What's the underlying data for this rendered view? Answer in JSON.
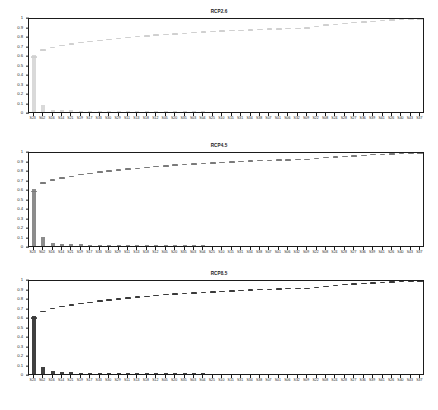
{
  "figure": {
    "caption": "",
    "panel_count": 3
  },
  "axes": {
    "yticks": [
      "0",
      "0.1",
      "0.2",
      "0.3",
      "0.4",
      "0.5",
      "0.6",
      "0.7",
      "0.8",
      "0.9",
      "1"
    ],
    "ylim": [
      0,
      1
    ],
    "xlabel": "",
    "ylabel": ""
  },
  "colors": {
    "bar_rcp26": "#d9d9d9",
    "bar_rcp45": "#8c8c8c",
    "bar_rcp85": "#404040",
    "curve_rcp26": "#d0d0d0",
    "curve_rcp45": "#7a7a7a",
    "curve_rcp85": "#3a3a3a",
    "axis": "#1b1b1b",
    "background": "#ffffff"
  },
  "chart_data": [
    {
      "type": "bar",
      "title": "RCP2.6",
      "xlabel": "",
      "ylabel": "",
      "ylim": [
        0,
        1
      ],
      "grid": false,
      "legend": "none",
      "categories": [
        "S23",
        "S02",
        "S16",
        "S14",
        "S21",
        "S19",
        "S17",
        "S33",
        "S30",
        "S29",
        "S11",
        "S13",
        "S18",
        "S12",
        "S05",
        "S20",
        "S35",
        "S03",
        "S04",
        "S25",
        "S10",
        "S15",
        "S31",
        "S34",
        "S38",
        "S07",
        "S01",
        "S06",
        "S32",
        "S09",
        "S22",
        "S08",
        "S24",
        "S28",
        "S27",
        "S36",
        "S39",
        "S41",
        "S26",
        "S40",
        "S43",
        "S37"
      ],
      "values": [
        0.6,
        0.075,
        0.025,
        0.02,
        0.016,
        0.014,
        0.013,
        0.012,
        0.011,
        0.01,
        0.009,
        0.009,
        0.008,
        0.008,
        0.007,
        0.007,
        0.006,
        0.006,
        0.006,
        0.005,
        0.005,
        0.005,
        0.004,
        0.004,
        0.004,
        0.004,
        0.003,
        0.003,
        0.003,
        0.003,
        0.002,
        0.002,
        0.002,
        0.002,
        0.002,
        0.002,
        0.001,
        0.001,
        0.001,
        0.001,
        0.001,
        0.001
      ],
      "cumulative": [
        0.6,
        0.675,
        0.7,
        0.72,
        0.736,
        0.75,
        0.763,
        0.775,
        0.786,
        0.796,
        0.805,
        0.814,
        0.822,
        0.83,
        0.837,
        0.844,
        0.85,
        0.856,
        0.862,
        0.867,
        0.872,
        0.877,
        0.881,
        0.885,
        0.889,
        0.893,
        0.896,
        0.899,
        0.902,
        0.905,
        0.921,
        0.935,
        0.945,
        0.954,
        0.962,
        0.969,
        0.976,
        0.982,
        0.988,
        0.993,
        0.997,
        1.0
      ]
    },
    {
      "type": "bar",
      "title": "RCP4.5",
      "xlabel": "",
      "ylabel": "",
      "ylim": [
        0,
        1
      ],
      "grid": false,
      "legend": "none",
      "categories": [
        "S23",
        "S02",
        "S16",
        "S14",
        "S21",
        "S19",
        "S17",
        "S33",
        "S30",
        "S29",
        "S11",
        "S13",
        "S18",
        "S12",
        "S05",
        "S20",
        "S35",
        "S03",
        "S04",
        "S25",
        "S10",
        "S15",
        "S31",
        "S34",
        "S38",
        "S07",
        "S01",
        "S06",
        "S32",
        "S09",
        "S22",
        "S08",
        "S24",
        "S28",
        "S27",
        "S36",
        "S39",
        "S41",
        "S26",
        "S40",
        "S43",
        "S37"
      ],
      "values": [
        0.595,
        0.09,
        0.03,
        0.022,
        0.018,
        0.016,
        0.014,
        0.013,
        0.012,
        0.011,
        0.01,
        0.009,
        0.009,
        0.008,
        0.008,
        0.007,
        0.007,
        0.006,
        0.006,
        0.005,
        0.005,
        0.005,
        0.004,
        0.004,
        0.004,
        0.004,
        0.003,
        0.003,
        0.003,
        0.003,
        0.003,
        0.002,
        0.002,
        0.002,
        0.002,
        0.002,
        0.002,
        0.001,
        0.001,
        0.001,
        0.001,
        0.001
      ],
      "cumulative": [
        0.595,
        0.685,
        0.715,
        0.737,
        0.755,
        0.771,
        0.785,
        0.798,
        0.81,
        0.821,
        0.831,
        0.84,
        0.849,
        0.857,
        0.865,
        0.872,
        0.879,
        0.885,
        0.891,
        0.896,
        0.901,
        0.906,
        0.91,
        0.914,
        0.918,
        0.922,
        0.925,
        0.928,
        0.931,
        0.934,
        0.941,
        0.95,
        0.957,
        0.964,
        0.97,
        0.976,
        0.982,
        0.987,
        0.991,
        0.995,
        0.998,
        1.0
      ]
    },
    {
      "type": "bar",
      "title": "RCP8.5",
      "xlabel": "",
      "ylabel": "",
      "ylim": [
        0,
        1
      ],
      "grid": false,
      "legend": "none",
      "categories": [
        "S23",
        "S02",
        "S16",
        "S14",
        "S21",
        "S19",
        "S17",
        "S33",
        "S30",
        "S29",
        "S11",
        "S13",
        "S18",
        "S12",
        "S05",
        "S20",
        "S35",
        "S03",
        "S04",
        "S25",
        "S10",
        "S15",
        "S31",
        "S34",
        "S38",
        "S07",
        "S01",
        "S06",
        "S32",
        "S09",
        "S22",
        "S08",
        "S24",
        "S28",
        "S27",
        "S36",
        "S39",
        "S41",
        "S26",
        "S40",
        "S43",
        "S37"
      ],
      "values": [
        0.61,
        0.07,
        0.028,
        0.021,
        0.017,
        0.015,
        0.014,
        0.013,
        0.012,
        0.011,
        0.01,
        0.009,
        0.009,
        0.008,
        0.008,
        0.007,
        0.007,
        0.006,
        0.006,
        0.005,
        0.005,
        0.005,
        0.004,
        0.004,
        0.004,
        0.004,
        0.003,
        0.003,
        0.003,
        0.003,
        0.003,
        0.002,
        0.002,
        0.002,
        0.002,
        0.002,
        0.002,
        0.001,
        0.001,
        0.001,
        0.001,
        0.001
      ],
      "cumulative": [
        0.61,
        0.68,
        0.708,
        0.729,
        0.746,
        0.761,
        0.775,
        0.788,
        0.8,
        0.811,
        0.821,
        0.83,
        0.839,
        0.847,
        0.855,
        0.862,
        0.869,
        0.875,
        0.881,
        0.886,
        0.891,
        0.896,
        0.9,
        0.904,
        0.908,
        0.912,
        0.915,
        0.918,
        0.921,
        0.924,
        0.934,
        0.944,
        0.952,
        0.96,
        0.967,
        0.973,
        0.979,
        0.985,
        0.99,
        0.995,
        0.998,
        1.0
      ]
    }
  ]
}
